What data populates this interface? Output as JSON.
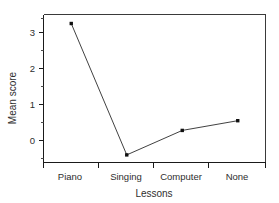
{
  "chart_data": {
    "type": "line",
    "title": "",
    "xlabel": "Lessons",
    "ylabel": "Mean score",
    "categories": [
      "Piano",
      "Singing",
      "Computer",
      "None"
    ],
    "values": [
      3.25,
      -0.4,
      0.28,
      0.55
    ],
    "series": [
      {
        "name": "Mean score",
        "values": [
          3.25,
          -0.4,
          0.28,
          0.55
        ]
      }
    ],
    "yticks": [
      0,
      1,
      2,
      3
    ],
    "ytick_labels": [
      "0",
      "1",
      "2",
      "3"
    ],
    "yminor_ticks": [
      -0.5,
      0.5,
      1.5,
      2.5,
      3.5
    ],
    "ylim": [
      -0.62,
      3.62
    ],
    "grid": false,
    "legend": null,
    "marker": "square",
    "line_color": "#2b2b2b",
    "marker_color": "#101010",
    "axis_color": "#1a1a1a"
  },
  "axes": {
    "y_title": "Mean score",
    "x_title": "Lessons",
    "y_tick_0": "0",
    "y_tick_1": "1",
    "y_tick_2": "2",
    "y_tick_3": "3",
    "x_cat_0": "Piano",
    "x_cat_1": "Singing",
    "x_cat_2": "Computer",
    "x_cat_3": "None"
  }
}
